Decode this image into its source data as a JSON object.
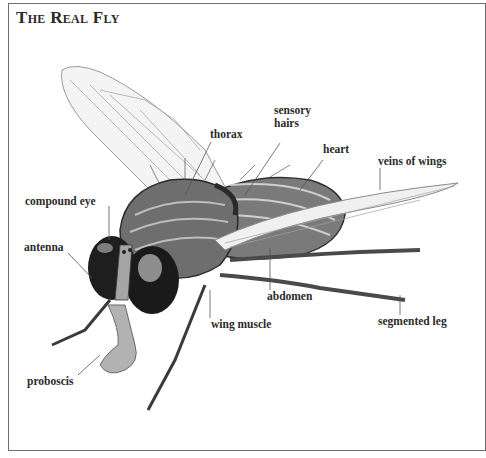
{
  "title": "The Real Fly",
  "labels": {
    "thorax": "thorax",
    "sensory_hairs_line1": "sensory",
    "sensory_hairs_line2": "hairs",
    "heart": "heart",
    "veins_of_wings": "veins of wings",
    "compound_eye": "compound eye",
    "antenna": "antenna",
    "abdomen": "abdomen",
    "wing_muscle": "wing muscle",
    "segmented_leg": "segmented leg",
    "proboscis": "proboscis"
  },
  "colors": {
    "frame": "#6e6e6e",
    "label_text": "#2b2b2b",
    "body_dark": "#3a3a3a",
    "body_mid": "#8a8a8a",
    "wing": "#f2f2f2"
  }
}
